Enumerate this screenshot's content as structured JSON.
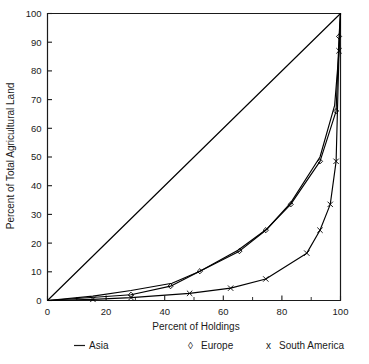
{
  "chart_data": {
    "type": "line",
    "title": "",
    "subtitle": "",
    "xlabel": "Percent of Holdings",
    "ylabel": "Percent of Total Agricultural Land",
    "xlim": [
      0,
      100
    ],
    "ylim": [
      0,
      100
    ],
    "xticks": [
      0,
      20,
      40,
      60,
      80,
      100
    ],
    "xticks_minor": [
      10,
      30,
      50,
      70,
      90
    ],
    "yticks": [
      0,
      10,
      20,
      30,
      40,
      50,
      60,
      70,
      80,
      90,
      100
    ],
    "grid": false,
    "legend_position": "bottom",
    "annotations": [],
    "series": [
      {
        "name": "Asia",
        "marker": "none",
        "legend_glyph": "—",
        "color": "#000000",
        "points": [
          {
            "x": 0,
            "y": 0
          },
          {
            "x": 15.5,
            "y": 1.5
          },
          {
            "x": 28.5,
            "y": 3.5
          },
          {
            "x": 42.5,
            "y": 6.0
          },
          {
            "x": 52.0,
            "y": 10.2
          },
          {
            "x": 65.0,
            "y": 17.5
          },
          {
            "x": 75.0,
            "y": 25.0
          },
          {
            "x": 83.0,
            "y": 34.0
          },
          {
            "x": 93.0,
            "y": 50.0
          },
          {
            "x": 98.0,
            "y": 68.0
          },
          {
            "x": 99.5,
            "y": 87.0
          },
          {
            "x": 100,
            "y": 100
          }
        ]
      },
      {
        "name": "Europe",
        "marker": "diamond",
        "legend_glyph": "◊",
        "color": "#000000",
        "points": [
          {
            "x": 0,
            "y": 0
          },
          {
            "x": 28.5,
            "y": 2.0
          },
          {
            "x": 42.0,
            "y": 5.0
          },
          {
            "x": 52.0,
            "y": 10.2
          },
          {
            "x": 65.5,
            "y": 17.2
          },
          {
            "x": 74.5,
            "y": 24.5
          },
          {
            "x": 83.0,
            "y": 33.5
          },
          {
            "x": 93.0,
            "y": 48.5
          },
          {
            "x": 98.5,
            "y": 66.0
          },
          {
            "x": 99.5,
            "y": 92.0
          },
          {
            "x": 100,
            "y": 100
          }
        ]
      },
      {
        "name": "South America",
        "marker": "cross",
        "legend_glyph": "x",
        "color": "#000000",
        "points": [
          {
            "x": 0,
            "y": 0
          },
          {
            "x": 15.5,
            "y": 0.4
          },
          {
            "x": 28.5,
            "y": 1.0
          },
          {
            "x": 48.5,
            "y": 2.5
          },
          {
            "x": 62.5,
            "y": 4.3
          },
          {
            "x": 74.5,
            "y": 7.5
          },
          {
            "x": 88.5,
            "y": 16.5
          },
          {
            "x": 93.0,
            "y": 24.5
          },
          {
            "x": 96.5,
            "y": 33.5
          },
          {
            "x": 98.5,
            "y": 48.5
          },
          {
            "x": 99.5,
            "y": 87.0
          },
          {
            "x": 100,
            "y": 100
          }
        ]
      },
      {
        "name": "Equality Line",
        "marker": "none",
        "legend_glyph": "",
        "color": "#000000",
        "points": [
          {
            "x": 0,
            "y": 0
          },
          {
            "x": 100,
            "y": 100
          }
        ]
      }
    ],
    "legend_entries": [
      {
        "glyph": "—",
        "label": "Asia"
      },
      {
        "glyph": "◊",
        "label": "Europe"
      },
      {
        "glyph": "x",
        "label": "South America"
      }
    ]
  }
}
